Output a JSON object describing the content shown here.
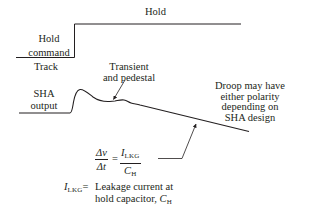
{
  "diagram": {
    "hold_command": {
      "label_line1": "Hold",
      "label_line2": "command",
      "state_high": "Hold",
      "state_low": "Track"
    },
    "sha_output": {
      "label_line1": "SHA",
      "label_line2": "output"
    },
    "annotations": {
      "transient_line1": "Transient",
      "transient_line2": "and pedestal",
      "droop_line1": "Droop may have",
      "droop_line2": "either polarity",
      "droop_line3": "depending on",
      "droop_line4": "SHA design"
    },
    "formula": {
      "lhs_num": "Δv",
      "lhs_den": "Δt",
      "equals": "=",
      "rhs_num_main": "I",
      "rhs_num_sub": "LKG",
      "rhs_den_main": "C",
      "rhs_den_sub": "H"
    },
    "legend": {
      "symbol_main": "I",
      "symbol_sub": "LKG",
      "equals": "=",
      "text_line1": "Leakage current at",
      "text_line2": "hold capacitor, ",
      "cap_main": "C",
      "cap_sub": "H"
    },
    "colors": {
      "ink": "#231f20",
      "background": "#ffffff"
    }
  }
}
